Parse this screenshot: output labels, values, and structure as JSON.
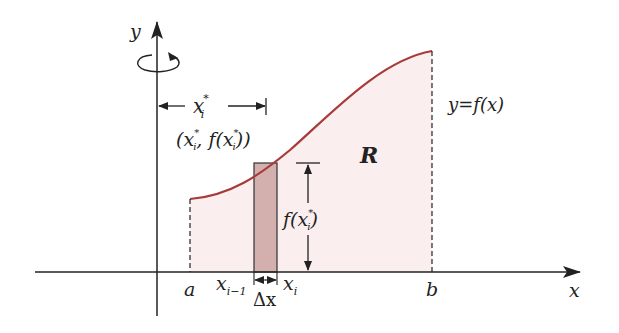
{
  "diagram": {
    "axes": {
      "x_label": "x",
      "y_label": "y"
    },
    "labels": {
      "a": "a",
      "b": "b",
      "x_i_minus_1": "x",
      "x_i_minus_1_sub": "i−1",
      "x_i": "x",
      "x_i_sub": "i",
      "delta_x": "Δx",
      "region": "R",
      "function": "y=f(x)",
      "xstar": "x",
      "xstar_sub": "i",
      "xstar_sup": "*",
      "point_label": "(x",
      "point_label_mid": ", f(x",
      "point_label_end": "))",
      "height_label": "f(x",
      "height_label_end": ")",
      "star": "*",
      "i": "i"
    },
    "colors": {
      "curve": "#a83a3a",
      "region_fill": "#fbeeee",
      "rectangle_fill": "#d3b0ae",
      "axis": "#222222"
    }
  }
}
